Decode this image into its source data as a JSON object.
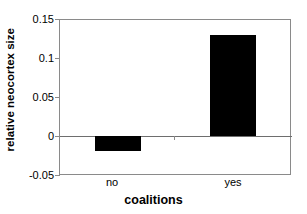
{
  "chart_data": {
    "type": "bar",
    "title": "",
    "subtitle": "",
    "xlabel": "coalitions",
    "ylabel": "relative neocortex size",
    "categories": [
      "no",
      "yes"
    ],
    "values": [
      -0.02,
      0.131
    ],
    "series": [
      {
        "name": "relative neocortex size",
        "values": [
          -0.02,
          0.131
        ]
      }
    ],
    "ylim": [
      -0.05,
      0.15
    ],
    "yticks": [
      0.15,
      0.1,
      0.05,
      0,
      -0.05
    ],
    "ytick_labels": [
      "0.15",
      "0.1",
      "0.05",
      "0",
      "-0.05"
    ],
    "grid": false,
    "legend": "none",
    "bar_color": "#000000",
    "axis_color": "#8a8a8a",
    "baseline_value": 0,
    "annotations": []
  },
  "axis": {
    "y_title": "relative neocortex size",
    "x_title": "coalitions",
    "ytick_0": "0.15",
    "ytick_1": "0.1",
    "ytick_2": "0.05",
    "ytick_3": "0",
    "ytick_4": "-0.05",
    "xtick_0": "no",
    "xtick_1": "yes"
  }
}
